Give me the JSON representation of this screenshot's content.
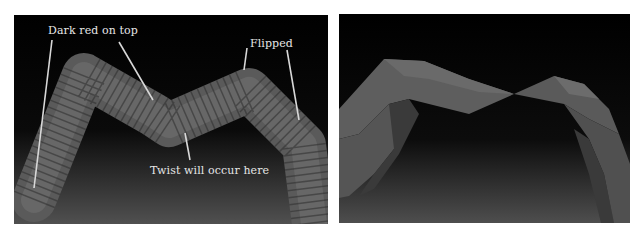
{
  "figure": {
    "left_panel": {
      "description": "Segmented tube rig bending in an M shape, with callouts",
      "annotations": [
        {
          "id": "dark-red-on-top",
          "text": "Dark red on top"
        },
        {
          "id": "flipped",
          "text": "Flipped"
        },
        {
          "id": "twist",
          "text": "Twist will occur here"
        }
      ]
    },
    "right_panel": {
      "description": "Low-poly ribbon mesh showing twist at the center"
    },
    "colors": {
      "background": "#000000",
      "floor_light": "#4a4a4a",
      "tube": "#6a6a6a",
      "tube_dark": "#3a3a3a",
      "callout_line": "#d8d8d8",
      "label_text": "#e6e6e6"
    }
  }
}
